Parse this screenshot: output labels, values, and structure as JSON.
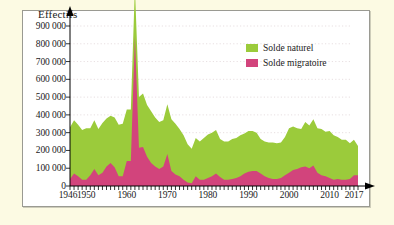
{
  "figure": {
    "background_color": "#fcfae3",
    "plot_background_color": "#ffffff",
    "frame_color": "#9a9a92"
  },
  "legend": {
    "position": "top-right-inside",
    "items": [
      {
        "label": "Solde naturel",
        "color": "#9bcb3b"
      },
      {
        "label": "Solde migratoire",
        "color": "#d2447c"
      }
    ]
  },
  "chart_data": {
    "type": "area",
    "stacked": true,
    "title": "",
    "ylabel": "Effectifs",
    "xlabel": "",
    "grid": true,
    "ylim": [
      0,
      900000
    ],
    "xlim": [
      1946,
      2017
    ],
    "ytick_labels": [
      "0",
      "100 000",
      "200 000",
      "300 000",
      "400 000",
      "500 000",
      "600 000",
      "700 000",
      "800 000",
      "900 000"
    ],
    "yticks": [
      0,
      100000,
      200000,
      300000,
      400000,
      500000,
      600000,
      700000,
      800000,
      900000
    ],
    "xtick_labels": [
      "1946",
      "1950",
      "1960",
      "1970",
      "1980",
      "1990",
      "2000",
      "2010",
      "2017"
    ],
    "xticks": [
      1946,
      1950,
      1960,
      1970,
      1980,
      1990,
      2000,
      2010,
      2017
    ],
    "x": [
      1946,
      1947,
      1948,
      1949,
      1950,
      1951,
      1952,
      1953,
      1954,
      1955,
      1956,
      1957,
      1958,
      1959,
      1960,
      1961,
      1962,
      1963,
      1964,
      1965,
      1966,
      1967,
      1968,
      1969,
      1970,
      1971,
      1972,
      1973,
      1974,
      1975,
      1976,
      1977,
      1978,
      1979,
      1980,
      1981,
      1982,
      1983,
      1984,
      1985,
      1986,
      1987,
      1988,
      1989,
      1990,
      1991,
      1992,
      1993,
      1994,
      1995,
      1996,
      1997,
      1998,
      1999,
      2000,
      2001,
      2002,
      2003,
      2004,
      2005,
      2006,
      2007,
      2008,
      2009,
      2010,
      2011,
      2012,
      2013,
      2014,
      2015,
      2016,
      2017
    ],
    "series": [
      {
        "name": "Solde migratoire",
        "color": "#d2447c",
        "values": [
          40000,
          70000,
          55000,
          35000,
          35000,
          60000,
          95000,
          60000,
          75000,
          110000,
          130000,
          105000,
          55000,
          55000,
          140000,
          140000,
          840000,
          215000,
          220000,
          165000,
          130000,
          110000,
          95000,
          110000,
          180000,
          85000,
          65000,
          55000,
          35000,
          20000,
          15000,
          55000,
          35000,
          35000,
          45000,
          55000,
          70000,
          50000,
          35000,
          35000,
          40000,
          45000,
          55000,
          70000,
          80000,
          85000,
          85000,
          70000,
          55000,
          45000,
          40000,
          40000,
          45000,
          60000,
          75000,
          90000,
          95000,
          105000,
          110000,
          100000,
          115000,
          75000,
          60000,
          55000,
          45000,
          35000,
          40000,
          35000,
          35000,
          40000,
          60000,
          60000
        ]
      },
      {
        "name": "Solde naturel",
        "color": "#9bcb3b",
        "values": [
          290000,
          300000,
          290000,
          280000,
          290000,
          265000,
          275000,
          260000,
          280000,
          270000,
          265000,
          280000,
          290000,
          295000,
          290000,
          290000,
          280000,
          285000,
          300000,
          290000,
          290000,
          275000,
          265000,
          260000,
          280000,
          290000,
          285000,
          265000,
          250000,
          215000,
          195000,
          215000,
          215000,
          235000,
          245000,
          245000,
          245000,
          215000,
          215000,
          215000,
          225000,
          225000,
          230000,
          225000,
          230000,
          225000,
          215000,
          195000,
          195000,
          200000,
          205000,
          200000,
          200000,
          215000,
          250000,
          245000,
          230000,
          215000,
          250000,
          240000,
          260000,
          250000,
          260000,
          250000,
          265000,
          250000,
          235000,
          225000,
          225000,
          200000,
          200000,
          165000
        ]
      }
    ]
  }
}
